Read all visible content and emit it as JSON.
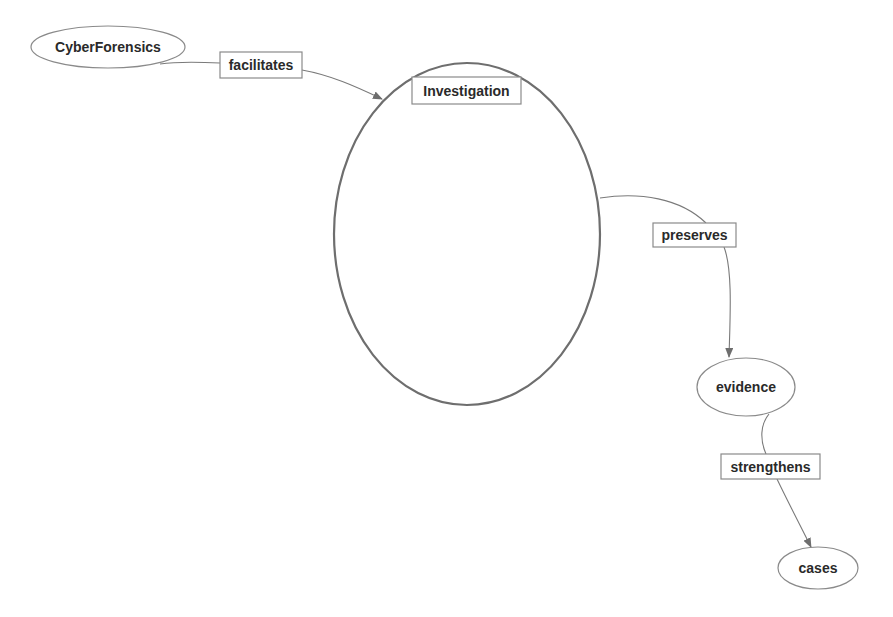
{
  "diagram": {
    "type": "concept-map",
    "nodes": [
      {
        "id": "cyberforensics",
        "label": "CyberForensics"
      },
      {
        "id": "investigation",
        "label": "Investigation"
      },
      {
        "id": "evidence",
        "label": "evidence"
      },
      {
        "id": "cases",
        "label": "cases"
      }
    ],
    "edges": [
      {
        "from": "CyberForensics",
        "to": "Investigation",
        "label": "facilitates"
      },
      {
        "from": "Investigation",
        "to": "evidence",
        "label": "preserves"
      },
      {
        "from": "evidence",
        "to": "cases",
        "label": "strengthens"
      }
    ]
  }
}
